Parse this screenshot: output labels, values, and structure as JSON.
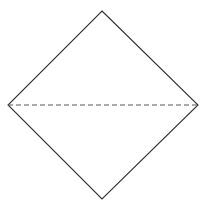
{
  "diagram": {
    "shape": "square rotated 45° (diamond)",
    "stroke_color": "#333333",
    "dash_color": "#555555",
    "vertices": {
      "top": [
        102,
        11
      ],
      "left": [
        8,
        105
      ],
      "right": [
        198,
        105
      ],
      "bottom": [
        102,
        199
      ]
    },
    "diagonal": {
      "style": "dashed",
      "from": "left",
      "to": "right",
      "dash_pattern": "5 3"
    }
  }
}
